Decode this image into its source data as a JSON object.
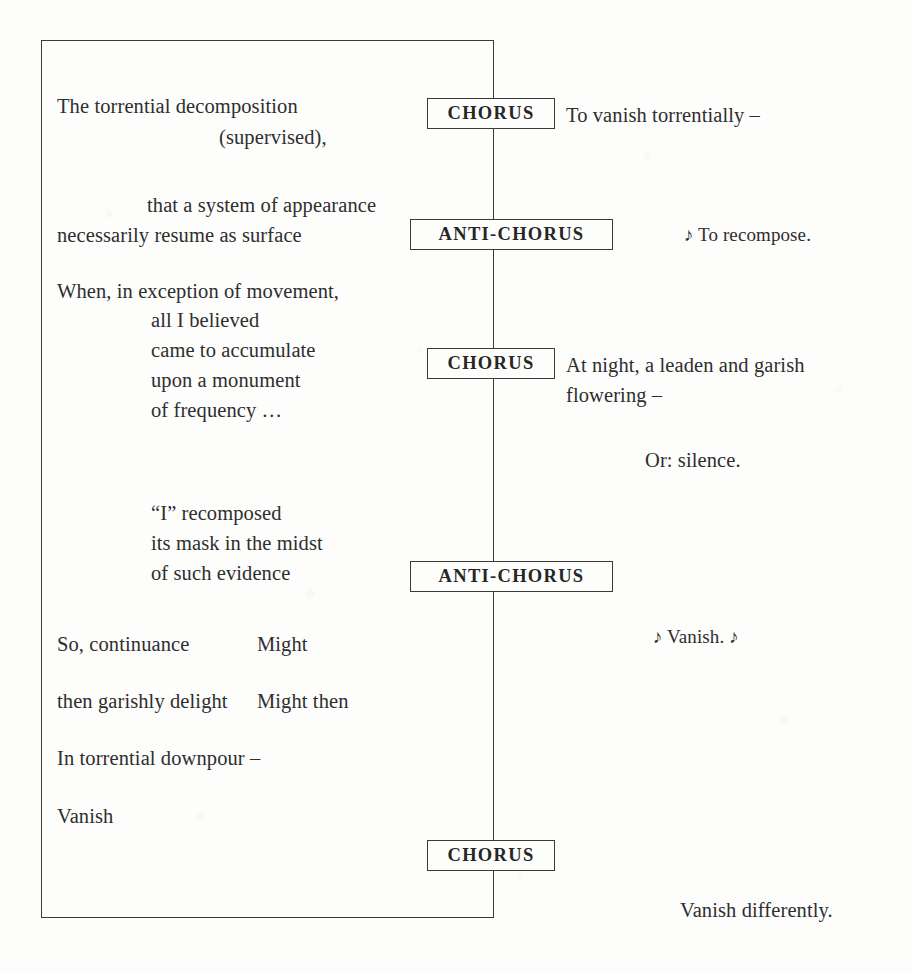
{
  "document": {
    "type": "poem-page",
    "background_color": "#fdfdfc",
    "ink_color": "#2e2e2e",
    "frame": {
      "name": "open-rectangle-border",
      "left": 41,
      "top": 40,
      "width": 453,
      "height": 878
    }
  },
  "left_column": {
    "stanzas": [
      {
        "lines": [
          {
            "text": "The torrential decomposition",
            "x": 57,
            "y": 93
          },
          {
            "text": "(supervised),",
            "x": 219,
            "y": 124
          }
        ]
      },
      {
        "lines": [
          {
            "text": "that a system of appearance",
            "x": 147,
            "y": 192
          },
          {
            "text": "necessarily resume as surface",
            "x": 57,
            "y": 222
          }
        ]
      },
      {
        "lines": [
          {
            "text": "When, in exception of movement,",
            "x": 57,
            "y": 278
          },
          {
            "text": "all I believed",
            "x": 151,
            "y": 307
          },
          {
            "text": "came to accumulate",
            "x": 151,
            "y": 337
          },
          {
            "text": "upon a monument",
            "x": 151,
            "y": 367
          },
          {
            "text": "of frequency …",
            "x": 151,
            "y": 397
          }
        ]
      },
      {
        "lines": [
          {
            "text": "“I” recomposed",
            "x": 151,
            "y": 500
          },
          {
            "text": "its mask in the midst",
            "x": 151,
            "y": 530
          },
          {
            "text": "of such evidence",
            "x": 151,
            "y": 560
          }
        ]
      },
      {
        "lines": [
          {
            "text": "So, continuance",
            "x": 57,
            "y": 631
          },
          {
            "text": "Might",
            "x": 257,
            "y": 631
          }
        ]
      },
      {
        "lines": [
          {
            "text": "then garishly delight",
            "x": 57,
            "y": 688
          },
          {
            "text": "Might then",
            "x": 257,
            "y": 688
          }
        ]
      },
      {
        "lines": [
          {
            "text": "In torrential downpour –",
            "x": 57,
            "y": 745
          }
        ]
      },
      {
        "lines": [
          {
            "text": "Vanish",
            "x": 57,
            "y": 803
          }
        ]
      }
    ]
  },
  "cues": [
    {
      "label": "CHORUS",
      "name": "cue-chorus-1",
      "left": 427,
      "top": 98,
      "width": 128,
      "height": 31
    },
    {
      "label": "ANTI-CHORUS",
      "name": "cue-anti-chorus-1",
      "left": 410,
      "top": 219,
      "width": 203,
      "height": 31
    },
    {
      "label": "CHORUS",
      "name": "cue-chorus-2",
      "left": 427,
      "top": 348,
      "width": 128,
      "height": 31
    },
    {
      "label": "ANTI-CHORUS",
      "name": "cue-anti-chorus-2",
      "left": 410,
      "top": 561,
      "width": 203,
      "height": 31
    },
    {
      "label": "CHORUS",
      "name": "cue-chorus-3",
      "left": 427,
      "top": 840,
      "width": 128,
      "height": 31
    }
  ],
  "right_column": {
    "lines": [
      {
        "text": "To vanish torrentially –",
        "x": 566,
        "y": 102
      },
      {
        "text": "♪ To recompose.",
        "x": 684,
        "y": 223
      },
      {
        "text": "At night, a leaden and garish",
        "x": 566,
        "y": 352
      },
      {
        "text": "flowering –",
        "x": 566,
        "y": 382
      },
      {
        "text": "Or: silence.",
        "x": 645,
        "y": 447
      },
      {
        "text": "♪ Vanish. ♪",
        "x": 653,
        "y": 625
      },
      {
        "text": "Vanish differently.",
        "x": 680,
        "y": 897
      }
    ]
  }
}
